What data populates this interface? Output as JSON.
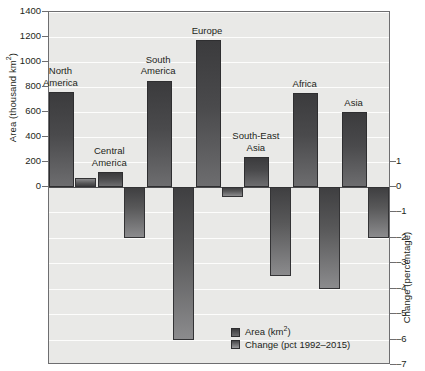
{
  "chart_data": {
    "type": "bar",
    "title": "",
    "subtitle": "",
    "categories": [
      "North America",
      "Central America",
      "South America",
      "Europe",
      "South-East Asia",
      "Africa",
      "Asia"
    ],
    "series": [
      {
        "name": "Area (km2)",
        "axis": "left",
        "values": [
          760,
          120,
          850,
          1175,
          240,
          750,
          600
        ]
      },
      {
        "name": "Change (pct 1992-2015)",
        "axis": "right",
        "values": [
          0.35,
          -2.0,
          -6.0,
          -0.4,
          -3.5,
          -4.0,
          -2.0
        ]
      }
    ],
    "ylabel": "Area (thousand km2)",
    "ylabel_right": "Change (percentage)",
    "xlabel": "",
    "ylim": [
      0,
      1400
    ],
    "ylim_right": [
      -7,
      1
    ],
    "yticks": [
      0,
      200,
      400,
      600,
      800,
      1000,
      1200,
      1400
    ],
    "yticks_right": [
      1,
      0,
      -1,
      -2,
      -3,
      -4,
      -5,
      -6,
      -7
    ],
    "grid": true,
    "legend_position": "bottom-right",
    "legend": [
      "Area (km2)",
      "Change (pct 1992-2015)"
    ]
  },
  "axes": {
    "left_title_pre": "Area (thousand km",
    "left_title_sup": "2",
    "left_title_post": ")",
    "right_title": "Change (percentage)",
    "left_ticks": [
      "1400",
      "1200",
      "1000",
      "800",
      "600",
      "400",
      "200",
      "0"
    ],
    "right_ticks": [
      "1",
      "0",
      "–1",
      "–2",
      "–3",
      "–4",
      "–5",
      "–6",
      "–7"
    ]
  },
  "categories": [
    {
      "line1": "North",
      "line2": "America"
    },
    {
      "line1": "Central",
      "line2": "America"
    },
    {
      "line1": "South",
      "line2": "America"
    },
    {
      "line1": "Europe",
      "line2": ""
    },
    {
      "line1": "South-East",
      "line2": "Asia"
    },
    {
      "line1": "Africa",
      "line2": ""
    },
    {
      "line1": "Asia",
      "line2": ""
    }
  ],
  "legend": {
    "area_pre": "Area (km",
    "area_sup": "2",
    "area_post": ")",
    "change": "Change (pct 1992–2015)"
  },
  "colors": {
    "plot_background": "#e9e9e7",
    "frame": "#6e6e70",
    "gridline": "#fdfdfc",
    "zeroline": "#4d4d4f",
    "bar_area": "#3b3b3d",
    "bar_change": "#585859",
    "text": "#231f20"
  }
}
